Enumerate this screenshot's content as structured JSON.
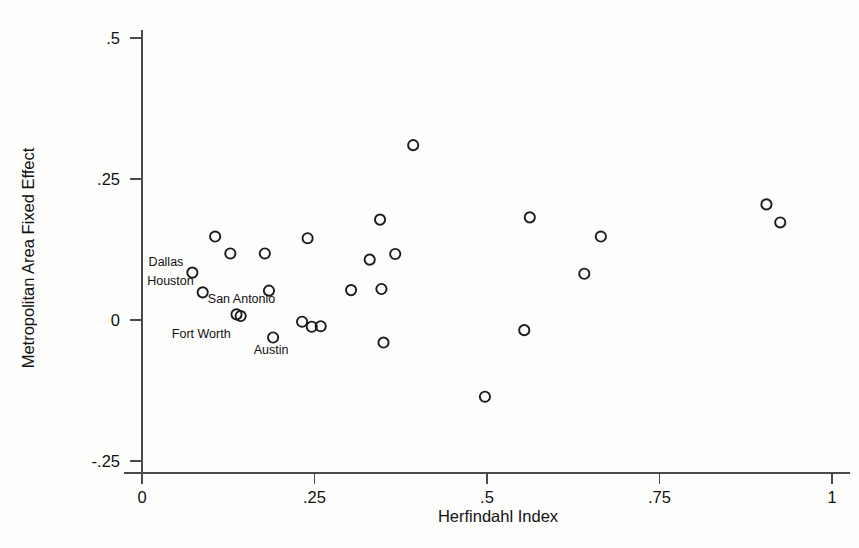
{
  "figure": {
    "background_color": "#fdfdfc",
    "marker_color": "#1c1c1c",
    "axis_color": "#4a4a4a"
  },
  "chart_data": {
    "type": "scatter",
    "title": "",
    "xlabel": "Herfindahl Index",
    "ylabel": "Metropolitan Area Fixed Effect",
    "xlim": [
      0,
      1
    ],
    "ylim": [
      -0.25,
      0.5
    ],
    "xticks": [
      0,
      0.25,
      0.5,
      0.75,
      1
    ],
    "xticklabels": [
      "0",
      ".25",
      ".5",
      ".75",
      "1"
    ],
    "yticks": [
      -0.25,
      0,
      0.25,
      0.5
    ],
    "yticklabels": [
      "-.25",
      "0",
      ".25",
      ".5"
    ],
    "grid": false,
    "legend": "none",
    "marker_style": "open-circle",
    "points": [
      {
        "x": 0.073,
        "y": 0.084,
        "label": "Dallas",
        "label_pos": "right"
      },
      {
        "x": 0.088,
        "y": 0.049,
        "label": "Houston",
        "label_pos": "right"
      },
      {
        "x": 0.106,
        "y": 0.148,
        "label": null,
        "label_pos": null
      },
      {
        "x": 0.128,
        "y": 0.118,
        "label": null,
        "label_pos": null
      },
      {
        "x": 0.137,
        "y": 0.01,
        "label": "San Antonio",
        "label_pos": "above"
      },
      {
        "x": 0.143,
        "y": 0.007,
        "label": "Fort Worth",
        "label_pos": "belowleft"
      },
      {
        "x": 0.178,
        "y": 0.118,
        "label": null,
        "label_pos": null
      },
      {
        "x": 0.184,
        "y": 0.052,
        "label": null,
        "label_pos": null
      },
      {
        "x": 0.19,
        "y": -0.031,
        "label": "Austin",
        "label_pos": "below"
      },
      {
        "x": 0.232,
        "y": -0.003,
        "label": null,
        "label_pos": null
      },
      {
        "x": 0.24,
        "y": 0.145,
        "label": null,
        "label_pos": null
      },
      {
        "x": 0.246,
        "y": -0.012,
        "label": null,
        "label_pos": null
      },
      {
        "x": 0.259,
        "y": -0.011,
        "label": null,
        "label_pos": null
      },
      {
        "x": 0.303,
        "y": 0.053,
        "label": null,
        "label_pos": null
      },
      {
        "x": 0.33,
        "y": 0.107,
        "label": null,
        "label_pos": null
      },
      {
        "x": 0.345,
        "y": 0.178,
        "label": null,
        "label_pos": null
      },
      {
        "x": 0.347,
        "y": 0.055,
        "label": null,
        "label_pos": null
      },
      {
        "x": 0.35,
        "y": -0.04,
        "label": null,
        "label_pos": null
      },
      {
        "x": 0.367,
        "y": 0.117,
        "label": null,
        "label_pos": null
      },
      {
        "x": 0.393,
        "y": 0.31,
        "label": null,
        "label_pos": null
      },
      {
        "x": 0.497,
        "y": -0.136,
        "label": null,
        "label_pos": null
      },
      {
        "x": 0.554,
        "y": -0.018,
        "label": null,
        "label_pos": null
      },
      {
        "x": 0.562,
        "y": 0.182,
        "label": null,
        "label_pos": null
      },
      {
        "x": 0.641,
        "y": 0.082,
        "label": null,
        "label_pos": null
      },
      {
        "x": 0.665,
        "y": 0.148,
        "label": null,
        "label_pos": null
      },
      {
        "x": 0.905,
        "y": 0.205,
        "label": null,
        "label_pos": null
      },
      {
        "x": 0.925,
        "y": 0.173,
        "label": null,
        "label_pos": null
      }
    ]
  }
}
